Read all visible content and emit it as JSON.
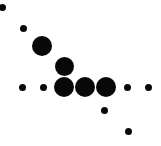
{
  "figure": {
    "width": 161,
    "height": 146,
    "background_color": "#ffffff",
    "marker_color": "#080808",
    "title": "",
    "xlabel": "",
    "ylabel": ""
  },
  "chart_data": {
    "type": "scatter",
    "title": "",
    "subtitle": "",
    "xlabel": "",
    "ylabel": "",
    "grid": false,
    "legend": null,
    "axes_visible": false,
    "tick_labels": {
      "x": [],
      "y": []
    },
    "xlim": [
      0,
      161
    ],
    "ylim": [
      146,
      0
    ],
    "size_encoding": "marker diameter in pixels",
    "marker_color": "#080808",
    "points": [
      {
        "id": "p1",
        "x": 2,
        "y": 7,
        "size": 7,
        "label": "point-1"
      },
      {
        "id": "p2",
        "x": 23,
        "y": 28,
        "size": 7,
        "label": "point-2"
      },
      {
        "id": "p3",
        "x": 42,
        "y": 46,
        "size": 20,
        "label": "point-3"
      },
      {
        "id": "p4",
        "x": 64,
        "y": 66,
        "size": 19,
        "label": "point-4"
      },
      {
        "id": "p5",
        "x": 22,
        "y": 87,
        "size": 7,
        "label": "point-5"
      },
      {
        "id": "p6",
        "x": 43,
        "y": 87,
        "size": 7,
        "label": "point-6"
      },
      {
        "id": "p7",
        "x": 64,
        "y": 87,
        "size": 20,
        "label": "point-7"
      },
      {
        "id": "p8",
        "x": 85,
        "y": 87,
        "size": 20,
        "label": "point-8"
      },
      {
        "id": "p9",
        "x": 106,
        "y": 87,
        "size": 20,
        "label": "point-9"
      },
      {
        "id": "p10",
        "x": 127,
        "y": 87,
        "size": 7,
        "label": "point-10"
      },
      {
        "id": "p11",
        "x": 148,
        "y": 87,
        "size": 7,
        "label": "point-11"
      },
      {
        "id": "p12",
        "x": 104,
        "y": 110,
        "size": 7,
        "label": "point-12"
      },
      {
        "id": "p13",
        "x": 128,
        "y": 131,
        "size": 7,
        "label": "point-13"
      }
    ]
  }
}
